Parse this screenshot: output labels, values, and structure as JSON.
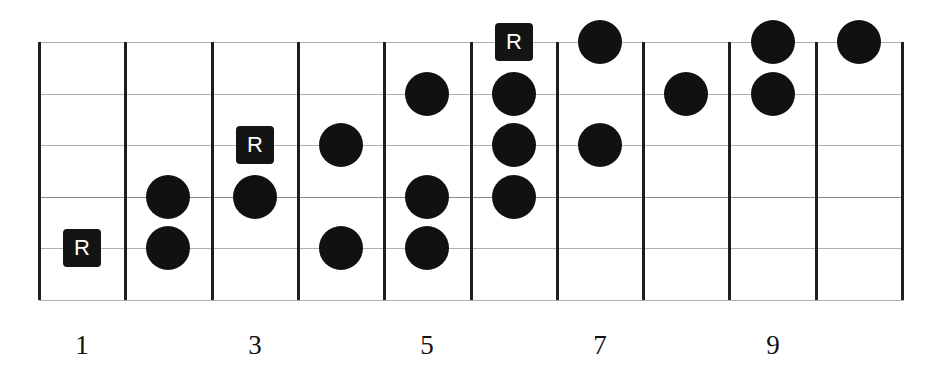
{
  "diagram": {
    "type": "guitar-fretboard-scale",
    "strings": 6,
    "frets": 10,
    "root_label": "R",
    "fret_numbers": [
      {
        "fret": 1,
        "label": "1"
      },
      {
        "fret": 3,
        "label": "3"
      },
      {
        "fret": 5,
        "label": "5"
      },
      {
        "fret": 7,
        "label": "7"
      },
      {
        "fret": 9,
        "label": "9"
      }
    ],
    "notes": [
      {
        "fret": 1,
        "string": 5,
        "root": true
      },
      {
        "fret": 2,
        "string": 4,
        "root": false
      },
      {
        "fret": 2,
        "string": 5,
        "root": false
      },
      {
        "fret": 3,
        "string": 3,
        "root": true
      },
      {
        "fret": 3,
        "string": 4,
        "root": false
      },
      {
        "fret": 4,
        "string": 3,
        "root": false
      },
      {
        "fret": 4,
        "string": 5,
        "root": false
      },
      {
        "fret": 5,
        "string": 2,
        "root": false
      },
      {
        "fret": 5,
        "string": 4,
        "root": false
      },
      {
        "fret": 5,
        "string": 5,
        "root": false
      },
      {
        "fret": 6,
        "string": 1,
        "root": true
      },
      {
        "fret": 6,
        "string": 2,
        "root": false
      },
      {
        "fret": 6,
        "string": 3,
        "root": false
      },
      {
        "fret": 6,
        "string": 4,
        "root": false
      },
      {
        "fret": 7,
        "string": 1,
        "root": false
      },
      {
        "fret": 7,
        "string": 3,
        "root": false
      },
      {
        "fret": 8,
        "string": 2,
        "root": false
      },
      {
        "fret": 9,
        "string": 1,
        "root": false
      },
      {
        "fret": 9,
        "string": 2,
        "root": false
      },
      {
        "fret": 10,
        "string": 1,
        "root": false
      }
    ],
    "colors": {
      "dot": "#111111",
      "root_box": "#141414",
      "root_text": "#ffffff",
      "fret_line": "#1e1e1e",
      "string_line": "#b0b0b0"
    }
  }
}
